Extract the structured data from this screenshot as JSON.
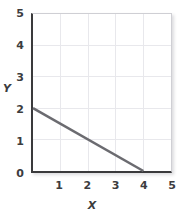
{
  "chart_data": {
    "type": "line",
    "title": "",
    "xlabel": "X",
    "ylabel": "Y",
    "xlim": [
      0,
      5
    ],
    "ylim": [
      0,
      5
    ],
    "grid": true,
    "legend": "none",
    "x_ticks": [
      "1",
      "2",
      "3",
      "4",
      "5"
    ],
    "x_tick_values": [
      1,
      2,
      3,
      4,
      5
    ],
    "y_ticks": [
      "0",
      "1",
      "2",
      "3",
      "4",
      "5"
    ],
    "y_tick_values": [
      0,
      1,
      2,
      3,
      4,
      5
    ],
    "series": [
      {
        "name": "line",
        "x": [
          0,
          4
        ],
        "y": [
          2,
          0
        ],
        "slope": -0.5,
        "y_intercept": 2,
        "x_intercept": 4,
        "color": "#6b6b70"
      }
    ]
  },
  "colors": {
    "line": "#6b6b70",
    "grid": "#e8e8ec",
    "axis": "#3a3a3c",
    "frame": "#cfcfd4",
    "text": "#3c3c3e",
    "background": "#ffffff"
  }
}
